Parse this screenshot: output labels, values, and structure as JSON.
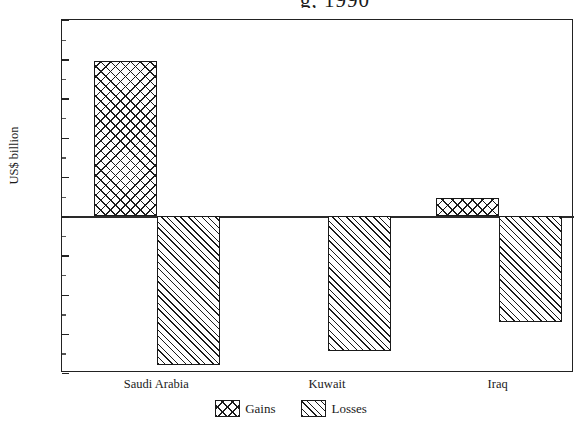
{
  "chart_data": {
    "type": "bar",
    "title": "",
    "title_cropped_fragment": "g, 1990",
    "xlabel": "",
    "ylabel": "US$ billion",
    "categories": [
      "Saudi Arabia",
      "Kuwait",
      "Iraq"
    ],
    "series": [
      {
        "name": "Gains",
        "values": [
          39.5,
          0,
          4.7
        ],
        "pattern": "cross-hatch"
      },
      {
        "name": "Losses",
        "values": [
          -38.0,
          -34.5,
          -27.0
        ],
        "pattern": "diagonal-stripe"
      }
    ],
    "ylim": [
      -40,
      50
    ],
    "yticks": [
      50,
      40,
      30,
      20,
      10,
      0,
      -10,
      -20,
      -30,
      -40
    ],
    "ytick_labels": [
      "50",
      "40",
      "30",
      "20",
      "10",
      "0",
      "−10",
      "−20",
      "−30",
      "−40"
    ],
    "grid": false,
    "legend_position": "bottom-center",
    "units": "US$ billion",
    "colors": {
      "line": "#1a1a1a",
      "fill": "#ffffff",
      "background": "#ffffff"
    }
  },
  "legend": {
    "entries": [
      {
        "label": "Gains",
        "swatch": "cross-hatch-swatch"
      },
      {
        "label": "Losses",
        "swatch": "diagonal-stripe-swatch"
      }
    ]
  }
}
